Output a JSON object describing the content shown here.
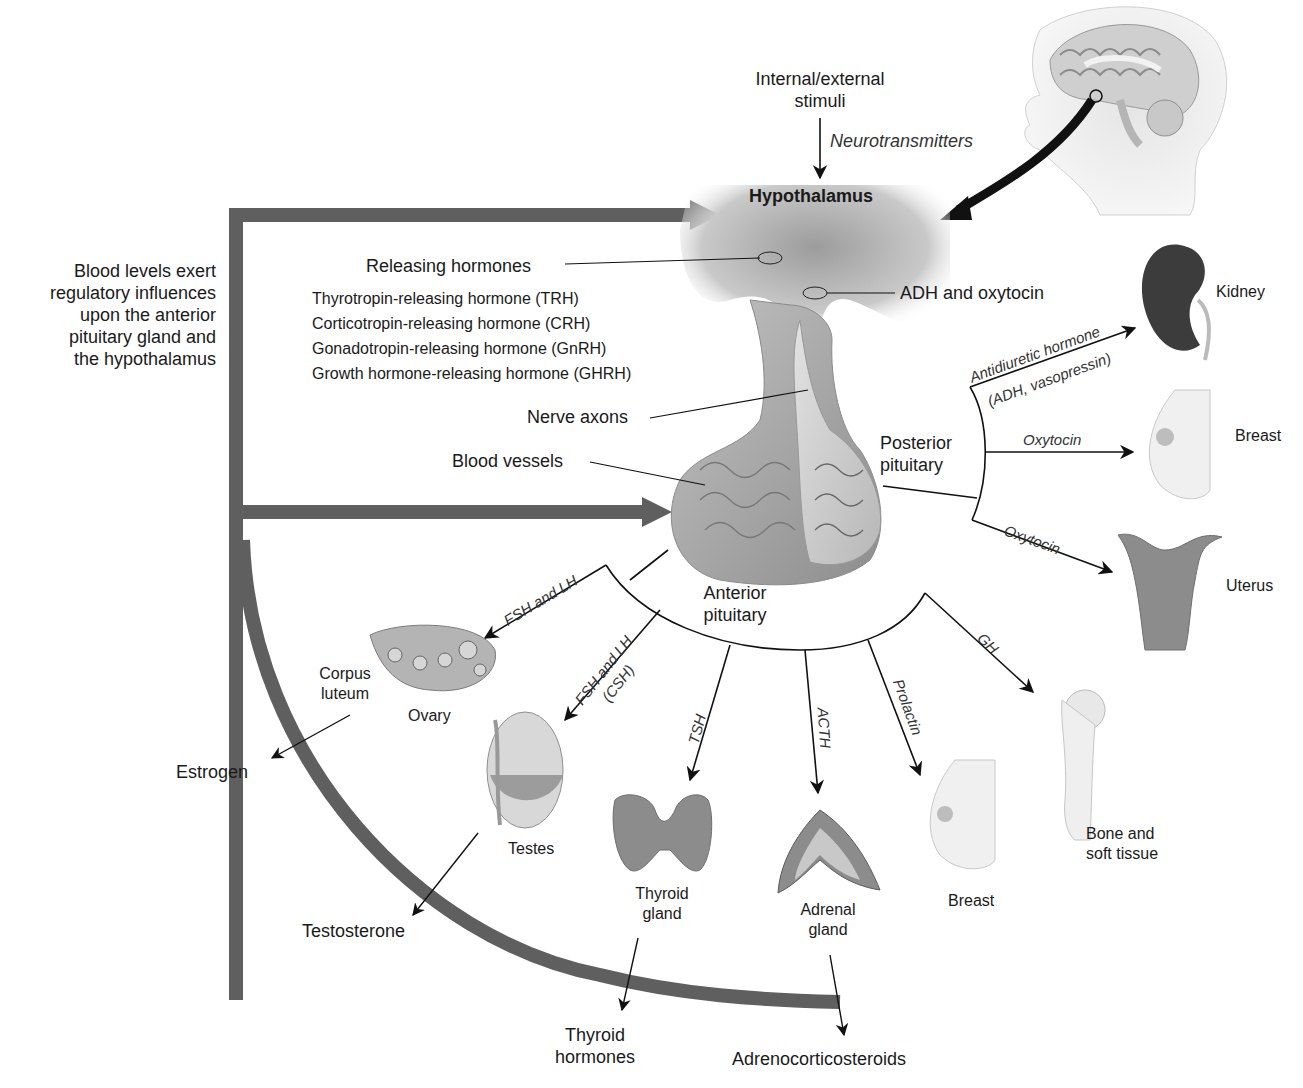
{
  "diagram": {
    "title_region": {
      "stimuli": [
        "Internal/external",
        "stimuli"
      ],
      "neurotransmitters": "Neurotransmitters",
      "hypothalamus": "Hypothalamus"
    },
    "feedback": {
      "text": [
        "Blood levels exert",
        "regulatory influences",
        "upon the anterior",
        "pituitary gland and",
        "the hypothalamus"
      ]
    },
    "releasing": {
      "heading": "Releasing hormones",
      "items": [
        "Thyrotropin-releasing hormone (TRH)",
        "Corticotropin-releasing hormone (CRH)",
        "Gonadotropin-releasing hormone (GnRH)",
        "Growth hormone-releasing hormone (GHRH)"
      ]
    },
    "structures": {
      "adh_oxytocin": "ADH and oxytocin",
      "nerve_axons": "Nerve axons",
      "blood_vessels": "Blood vessels",
      "posterior": [
        "Posterior",
        "pituitary"
      ],
      "anterior": [
        "Anterior",
        "pituitary"
      ]
    },
    "posterior_targets": [
      {
        "hormone": "Antidiuretic hormone",
        "hormone_sub": "(ADH, vasopressin)",
        "target": "Kidney"
      },
      {
        "hormone": "Oxytocin",
        "target": "Breast"
      },
      {
        "hormone": "Oxytocin",
        "target": "Uterus"
      }
    ],
    "anterior_targets": [
      {
        "hormone": "FSH and LH",
        "target": "Ovary",
        "sub_label": [
          "Corpus",
          "luteum"
        ],
        "product": "Estrogen"
      },
      {
        "hormone": "FSH and LH",
        "hormone_sub": "(CSH)",
        "target": "Testes",
        "product": "Testosterone"
      },
      {
        "hormone": "TSH",
        "target": [
          "Thyroid",
          "gland"
        ],
        "product": [
          "Thyroid",
          "hormones"
        ]
      },
      {
        "hormone": "ACTH",
        "target": [
          "Adrenal",
          "gland"
        ],
        "product": "Adrenocorticosteroids"
      },
      {
        "hormone": "Prolactin",
        "target": "Breast"
      },
      {
        "hormone": "GH",
        "target": [
          "Bone and",
          "soft tissue"
        ]
      }
    ],
    "colors": {
      "feedback_band": "#5f5f5f",
      "organ_fill": "#a9a9a9",
      "organ_dark": "#3c3c3c",
      "line": "#111111",
      "text": "#1a1a1a"
    }
  }
}
